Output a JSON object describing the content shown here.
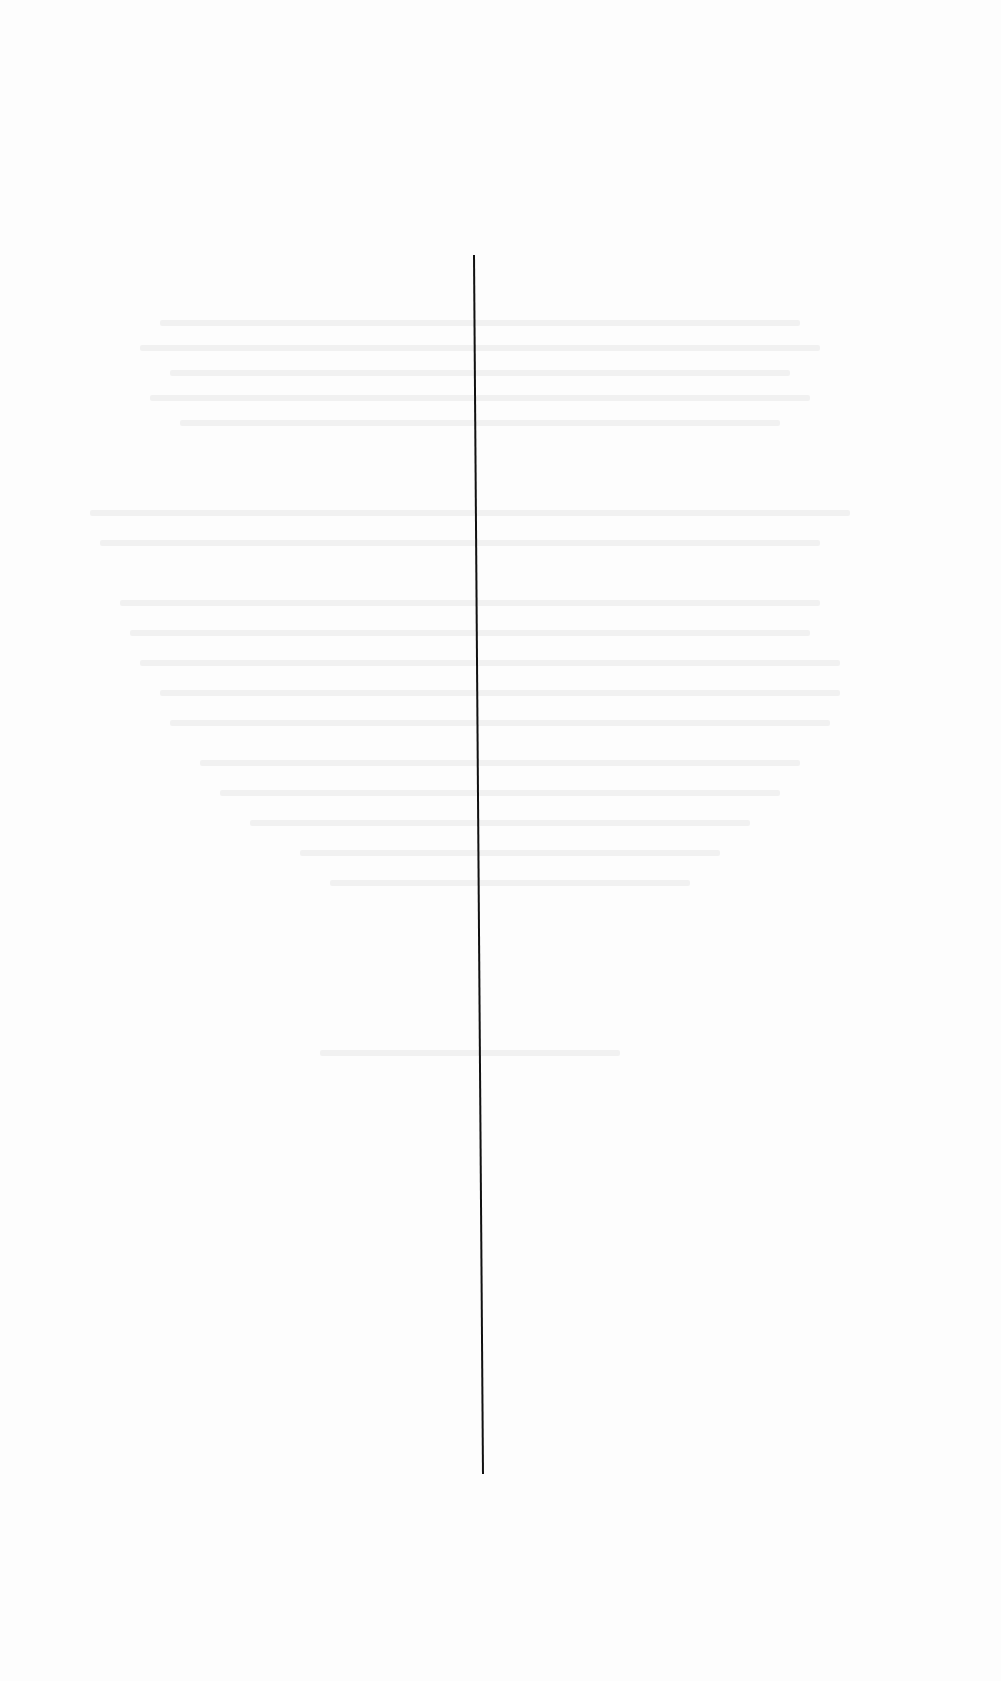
{
  "page": {
    "background_color": "#fdfdfd",
    "vertical_rule": {
      "x1": 474,
      "y1": 255,
      "x2": 483,
      "y2": 1474,
      "stroke_width": 2,
      "color": "#111111"
    },
    "visible_text": []
  }
}
